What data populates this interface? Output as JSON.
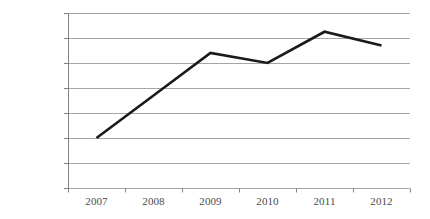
{
  "chart_data": {
    "type": "line",
    "title": "",
    "subtitle": "",
    "xlabel": "",
    "ylabel": "",
    "categories": [
      "2007",
      "2008",
      "2009",
      "2010",
      "2011",
      "2012"
    ],
    "series": [
      {
        "name": "",
        "values": [
          20,
          37,
          54,
          50,
          62.5,
          57
        ]
      }
    ],
    "ytick_labels": [
      "0%",
      "10%",
      "20%",
      "30%",
      "40%",
      "50%",
      "60%",
      "70%"
    ],
    "ytick_values": [
      0,
      10,
      20,
      30,
      40,
      50,
      60,
      70
    ],
    "ylim": [
      0,
      70
    ],
    "value_suffix": "%",
    "grid": true,
    "grid_axis": "y",
    "legend": false,
    "legend_position": "none",
    "colors": {
      "line": "#1a1a1a",
      "grid": "#a6a6a6",
      "axis": "#808080",
      "tick_text": "#4a4a4a",
      "background": "#ffffff"
    },
    "style": {
      "line_width": 2.6,
      "plot_left": 68,
      "plot_right": 410,
      "plot_top": 13,
      "plot_bottom": 188
    }
  }
}
